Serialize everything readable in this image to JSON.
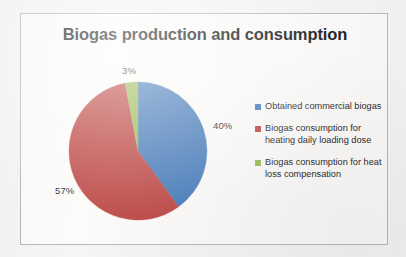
{
  "frame": {
    "background_color": "#fcfbfa",
    "border_color": "#b9b9b9",
    "page_background": "#f6f5f3"
  },
  "chart_data": {
    "type": "pie",
    "title": "Biogas production and consumption",
    "xlabel": "",
    "ylabel": "",
    "grid": false,
    "legend_position": "right",
    "start_angle_deg": 0,
    "direction": "clockwise",
    "categories": [
      "Obtained commercial biogas",
      "Biogas consumption for heating daily loading dose",
      "Biogas consumption for heat loss compensation"
    ],
    "values": [
      40,
      57,
      3
    ],
    "value_unit": "%",
    "data_labels": [
      "40%",
      "57%",
      "3%"
    ],
    "colors": [
      "#4A7EBB",
      "#BE4B48",
      "#9BBB59"
    ],
    "slices": [
      {
        "label": "Obtained commercial biogas",
        "value": 40,
        "data_label": "40%",
        "color": "#4A7EBB",
        "start_deg": 0,
        "sweep_deg": 144
      },
      {
        "label": "Biogas consumption for heating daily loading dose",
        "value": 57,
        "data_label": "57%",
        "color": "#BE4B48",
        "start_deg": 144,
        "sweep_deg": 205.2
      },
      {
        "label": "Biogas consumption for heat loss compensation",
        "value": 3,
        "data_label": "3%",
        "color": "#9BBB59",
        "start_deg": 349.2,
        "sweep_deg": 10.8
      }
    ]
  },
  "legend": {
    "items": [
      {
        "label": "Obtained commercial biogas",
        "color": "#4A7EBB"
      },
      {
        "label": "Biogas consumption for heating daily loading dose",
        "color": "#BE4B48"
      },
      {
        "label": "Biogas consumption for heat loss compensation",
        "color": "#9BBB59"
      }
    ]
  }
}
